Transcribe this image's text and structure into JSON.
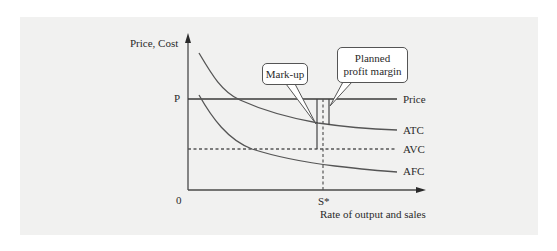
{
  "diagram": {
    "axes": {
      "y_label": "Price, Cost",
      "x_label": "Rate of output and sales",
      "origin_label": "0",
      "price_level_label": "P",
      "output_label": "S*"
    },
    "curves": [
      {
        "id": "price",
        "label": "Price",
        "style": "solid"
      },
      {
        "id": "atc",
        "label": "ATC",
        "style": "solid"
      },
      {
        "id": "avc",
        "label": "AVC",
        "style": "dashed"
      },
      {
        "id": "afc",
        "label": "AFC",
        "style": "solid"
      }
    ],
    "callouts": {
      "markup": "Mark-up",
      "profit_line1": "Planned",
      "profit_line2": "profit margin"
    },
    "colors": {
      "panel_bg": "#f1f1f0",
      "line": "#4a4a4a",
      "text": "#2a2a2a"
    }
  }
}
